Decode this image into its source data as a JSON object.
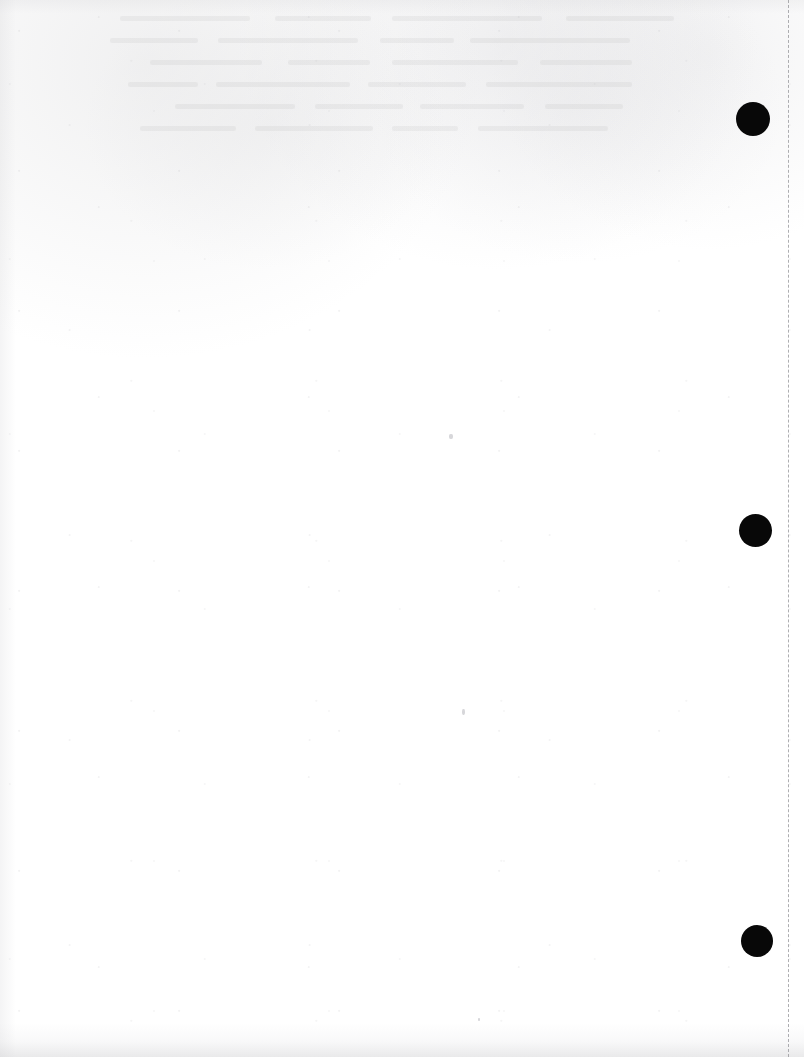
{
  "document": {
    "page_type": "blank-scanned-page",
    "page_width": 804,
    "page_height": 1057,
    "background_color": "#ffffff",
    "visible_text": "",
    "caption": ""
  },
  "perforation": {
    "name": "dashed-perforation-line",
    "orientation": "vertical",
    "x": 788,
    "color": "#9a9a9e",
    "dash_length": 7,
    "gap_length": 5,
    "stroke_width": 1.4
  },
  "punch_holes": {
    "color": "#080808",
    "count": 3,
    "items": [
      {
        "label": "punch-hole-top",
        "cx": 753,
        "cy": 119,
        "d": 34
      },
      {
        "label": "punch-hole-middle",
        "cx": 755,
        "cy": 530,
        "d": 33
      },
      {
        "label": "punch-hole-bottom",
        "cx": 757,
        "cy": 941,
        "d": 32
      }
    ]
  },
  "stray_marks": {
    "items": [
      {
        "label": "speck-upper-middle",
        "x": 449,
        "y": 434,
        "w": 4,
        "h": 5
      },
      {
        "label": "speck-lower-middle",
        "x": 462,
        "y": 709,
        "w": 3,
        "h": 6
      },
      {
        "label": "speck-lower-center",
        "x": 478,
        "y": 1018,
        "w": 2,
        "h": 3
      }
    ]
  },
  "scan_artifacts": {
    "bottom_shadow_color": "#c6c6c9",
    "left_shadow_color": "#cdcdd0",
    "show_through_opacity": "0.055",
    "texture": "paper-grain"
  }
}
